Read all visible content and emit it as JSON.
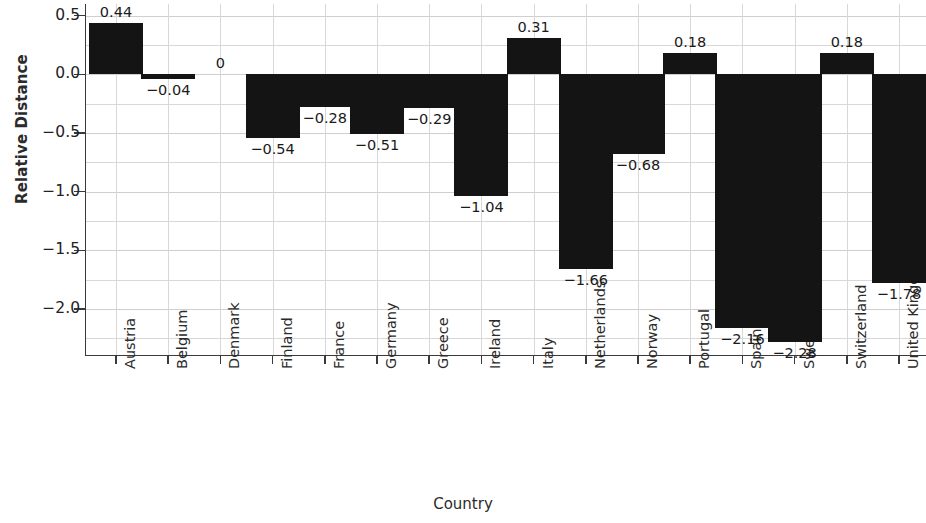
{
  "chart_data": {
    "type": "bar",
    "title": "",
    "xlabel": "Country",
    "ylabel": "Relative Distance",
    "ylim": [
      -2.4,
      0.6
    ],
    "grid": true,
    "legend": "none",
    "orientation": "vertical",
    "bar_color": "#141414",
    "y_ticks": [
      "0.5",
      "0.0",
      "−0.5",
      "−1.0",
      "−1.5",
      "−2.0"
    ],
    "y_tick_values": [
      0.5,
      0.0,
      -0.5,
      -1.0,
      -1.5,
      -2.0
    ],
    "minor_tick_step": 0.25,
    "categories": [
      "Austria",
      "Belgium",
      "Denmark",
      "Finland",
      "France",
      "Germany",
      "Greece",
      "Ireland",
      "Italy",
      "Netherlands",
      "Norway",
      "Portugal",
      "Spain",
      "Sweden",
      "Switzerland",
      "United Kingdom"
    ],
    "values": [
      0.44,
      -0.04,
      0,
      -0.54,
      -0.28,
      -0.51,
      -0.29,
      -1.04,
      0.31,
      -1.66,
      -0.68,
      0.18,
      -2.16,
      -2.28,
      0.18,
      -1.78
    ],
    "data_labels": [
      "0.44",
      "−0.04",
      "0",
      "−0.54",
      "−0.28",
      "−0.51",
      "−0.29",
      "−1.04",
      "0.31",
      "−1.66",
      "−0.68",
      "0.18",
      "−2.16",
      "−2.28",
      "0.18",
      "−1.78"
    ]
  }
}
